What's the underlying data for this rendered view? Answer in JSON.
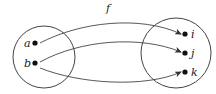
{
  "diagram": {
    "type": "function-mapping",
    "function_label": "f",
    "domain_set": {
      "elements": [
        {
          "id": "a",
          "label": "a"
        },
        {
          "id": "b",
          "label": "b"
        }
      ]
    },
    "codomain_set": {
      "elements": [
        {
          "id": "i",
          "label": "i"
        },
        {
          "id": "j",
          "label": "j"
        },
        {
          "id": "k",
          "label": "k"
        }
      ]
    },
    "mappings": [
      {
        "from": "a",
        "to": "i"
      },
      {
        "from": "b",
        "to": "j"
      },
      {
        "from": "b",
        "to": "k"
      }
    ],
    "colors": {
      "stroke": "#333333",
      "point": "#111111",
      "background": "#ffffff"
    }
  }
}
